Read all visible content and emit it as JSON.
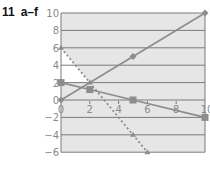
{
  "title": {
    "number": "11",
    "label": "a–f"
  },
  "colors": {
    "plot_background": "#e6e6e6",
    "white_region": "#ffffff",
    "grid": "#7a7a7a",
    "line": "#8c8c8c",
    "tick_text": "#8a8a8a"
  },
  "chart_data": {
    "type": "line",
    "xlabel": "",
    "ylabel": "",
    "xlim": [
      0,
      10
    ],
    "ylim": [
      -6,
      10
    ],
    "x_ticks": [
      "0",
      "2",
      "4",
      "6",
      "8",
      "10"
    ],
    "y_ticks": [
      "10",
      "8",
      "6",
      "4",
      "2",
      "0",
      "-2",
      "-4",
      "-6"
    ],
    "grid": "horizontal",
    "legend": "none",
    "series": [
      {
        "name": "increasing line (diamond markers)",
        "style": "solid",
        "marker": "diamond",
        "points": [
          [
            0,
            0
          ],
          [
            5,
            5
          ],
          [
            10,
            10
          ]
        ]
      },
      {
        "name": "decreasing line (square markers)",
        "style": "solid",
        "marker": "square",
        "points": [
          [
            0,
            2
          ],
          [
            2,
            1.2
          ],
          [
            5,
            0
          ],
          [
            10,
            -2
          ]
        ]
      },
      {
        "name": "steep decreasing line (dashed)",
        "style": "dashed",
        "marker": "triangle",
        "points": [
          [
            0,
            6
          ],
          [
            2,
            2
          ],
          [
            5,
            -4
          ],
          [
            6,
            -6
          ]
        ]
      }
    ],
    "shaded_regions": [
      {
        "description": "white triangle between x=0, y=2 and dashed line",
        "vertices": [
          [
            0,
            6
          ],
          [
            0,
            2
          ],
          [
            2,
            2
          ]
        ]
      }
    ]
  }
}
